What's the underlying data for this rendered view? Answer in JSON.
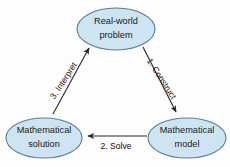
{
  "diagram": {
    "background_color": "#fdfdfd",
    "node_fill_color": "#cde4f2",
    "node_stroke_color": "#5b7f98",
    "edge_color": "#2b2b2b",
    "text_color": "#1a1a1a",
    "nodes": [
      {
        "id": "real-world-problem",
        "line1": "Real-world",
        "line2": "problem",
        "cx": 116,
        "cy": 29,
        "rx": 39,
        "ry": 21
      },
      {
        "id": "mathematical-model",
        "line1": "Mathematical",
        "line2": "model",
        "cx": 187,
        "cy": 138,
        "rx": 39,
        "ry": 20
      },
      {
        "id": "mathematical-solution",
        "line1": "Mathematical",
        "line2": "solution",
        "cx": 44,
        "cy": 138,
        "rx": 38,
        "ry": 20
      }
    ],
    "edges": [
      {
        "id": "construct",
        "label": "1. Construct",
        "from": "real-world-problem",
        "to": "mathematical-model",
        "label_x": 161,
        "label_y": 79,
        "label_rotation": 57
      },
      {
        "id": "solve",
        "label": "2. Solve",
        "from": "mathematical-model",
        "to": "mathematical-solution",
        "label_x": 116,
        "label_y": 147,
        "label_rotation": 0
      },
      {
        "id": "interpret",
        "label": "3. Interpret",
        "from": "mathematical-solution",
        "to": "real-world-problem",
        "label_x": 64,
        "label_y": 81,
        "label_rotation": -57
      }
    ]
  }
}
